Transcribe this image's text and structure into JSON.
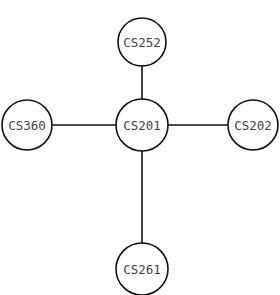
{
  "diagram": {
    "type": "graph",
    "nodes": [
      {
        "id": "CS252",
        "label": "CS252"
      },
      {
        "id": "CS360",
        "label": "CS360"
      },
      {
        "id": "CS201",
        "label": "CS201"
      },
      {
        "id": "CS202",
        "label": "CS202"
      },
      {
        "id": "CS261",
        "label": "CS261"
      }
    ],
    "edges": [
      {
        "from": "CS201",
        "to": "CS252"
      },
      {
        "from": "CS201",
        "to": "CS360"
      },
      {
        "from": "CS201",
        "to": "CS202"
      },
      {
        "from": "CS201",
        "to": "CS261"
      }
    ]
  }
}
